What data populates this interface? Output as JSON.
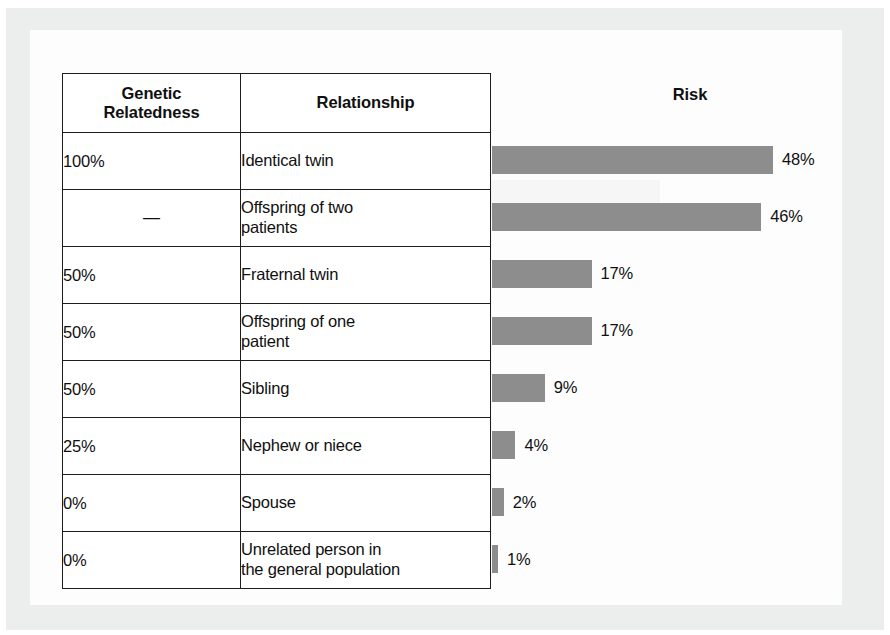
{
  "figure": {
    "columns": {
      "genetic_relatedness": "Genetic\nRelatedness",
      "genetic_relatedness_line1": "Genetic",
      "genetic_relatedness_line2": "Relatedness",
      "relationship": "Relationship",
      "risk": "Risk"
    },
    "bar_color": "#8d8d8d",
    "text_color": "#101010"
  },
  "chart_data": {
    "type": "bar",
    "title": "Risk",
    "xlabel": "",
    "ylabel": "",
    "orientation": "horizontal",
    "grid": false,
    "legend": false,
    "xlim": [
      0,
      48
    ],
    "categories": [
      "Identical twin",
      "Offspring of two patients",
      "Fraternal twin",
      "Offspring of one patient",
      "Sibling",
      "Nephew or niece",
      "Spouse",
      "Unrelated person in the general population"
    ],
    "values": [
      48,
      46,
      17,
      17,
      9,
      4,
      2,
      1
    ],
    "value_labels": [
      "48%",
      "46%",
      "17%",
      "17%",
      "9%",
      "4%",
      "2%",
      "1%"
    ],
    "genetic_relatedness": [
      "100%",
      "—",
      "50%",
      "50%",
      "50%",
      "25%",
      "0%",
      "0%"
    ]
  },
  "rows": [
    {
      "genetic_relatedness": "100%",
      "relationship_line1": "Identical twin",
      "relationship_line2": "",
      "risk_label": "48%",
      "risk_value": 48
    },
    {
      "genetic_relatedness": "—",
      "relationship_line1": "Offspring of two",
      "relationship_line2": "patients",
      "risk_label": "46%",
      "risk_value": 46
    },
    {
      "genetic_relatedness": "50%",
      "relationship_line1": "Fraternal twin",
      "relationship_line2": "",
      "risk_label": "17%",
      "risk_value": 17
    },
    {
      "genetic_relatedness": "50%",
      "relationship_line1": "Offspring of one",
      "relationship_line2": "patient",
      "risk_label": "17%",
      "risk_value": 17
    },
    {
      "genetic_relatedness": "50%",
      "relationship_line1": "Sibling",
      "relationship_line2": "",
      "risk_label": "9%",
      "risk_value": 9
    },
    {
      "genetic_relatedness": "25%",
      "relationship_line1": "Nephew or niece",
      "relationship_line2": "",
      "risk_label": "4%",
      "risk_value": 4
    },
    {
      "genetic_relatedness": "0%",
      "relationship_line1": "Spouse",
      "relationship_line2": "",
      "risk_label": "2%",
      "risk_value": 2
    },
    {
      "genetic_relatedness": "0%",
      "relationship_line1": "Unrelated person in",
      "relationship_line2": "the general population",
      "risk_label": "1%",
      "risk_value": 1
    }
  ]
}
